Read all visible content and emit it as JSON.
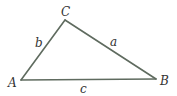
{
  "diagram": {
    "type": "triangle",
    "colors": {
      "line": "#5f6b5f",
      "label": "#333333",
      "background": "#ffffff"
    },
    "vertices": [
      {
        "name": "A",
        "label": "A",
        "x": 21,
        "y": 80,
        "label_x": 8,
        "label_y": 87
      },
      {
        "name": "B",
        "label": "B",
        "x": 156,
        "y": 79,
        "label_x": 160,
        "label_y": 85
      },
      {
        "name": "C",
        "label": "C",
        "x": 65,
        "y": 20,
        "label_x": 61,
        "label_y": 16
      }
    ],
    "sides": [
      {
        "name": "a",
        "label": "a",
        "from": "B",
        "to": "C",
        "label_x": 110,
        "label_y": 46
      },
      {
        "name": "b",
        "label": "b",
        "from": "A",
        "to": "C",
        "label_x": 35,
        "label_y": 47
      },
      {
        "name": "c",
        "label": "c",
        "from": "A",
        "to": "B",
        "label_x": 80,
        "label_y": 93
      }
    ]
  }
}
